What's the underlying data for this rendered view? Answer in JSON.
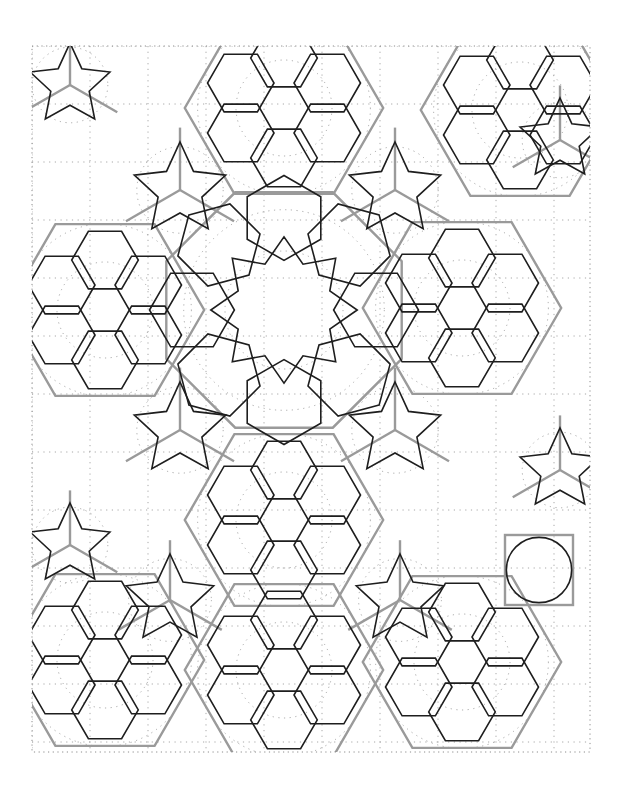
{
  "figure": {
    "title": "Geometric strapwork pattern with 6-fold and 8-fold rosettes",
    "width": 623,
    "height": 796,
    "frame": {
      "x0": 32,
      "y0": 46,
      "x1": 590,
      "y1": 752
    },
    "colors": {
      "background": "#ffffff",
      "strap": "#1e1e1e",
      "construction": "#9a9a9a",
      "dotted": "#8c8c8c"
    },
    "stroke_widths": {
      "strap": 1.6,
      "construction": 2.4,
      "dotted": 1.0
    }
  },
  "rosettes": {
    "hex": [
      {
        "cx": 284,
        "cy": 108,
        "r": 64
      },
      {
        "cx": 105,
        "cy": 310,
        "r": 64
      },
      {
        "cx": 462,
        "cy": 308,
        "r": 64
      },
      {
        "cx": 284,
        "cy": 520,
        "r": 64
      },
      {
        "cx": 284,
        "cy": 670,
        "r": 64
      },
      {
        "cx": 105,
        "cy": 660,
        "r": 64
      },
      {
        "cx": 462,
        "cy": 662,
        "r": 64
      },
      {
        "cx": 520,
        "cy": 110,
        "r": 64
      }
    ],
    "oct": [
      {
        "cx": 284,
        "cy": 310,
        "r": 118
      }
    ],
    "star5": [
      {
        "cx": 70,
        "cy": 85,
        "r": 42
      },
      {
        "cx": 180,
        "cy": 190,
        "r": 48
      },
      {
        "cx": 395,
        "cy": 190,
        "r": 48
      },
      {
        "cx": 180,
        "cy": 430,
        "r": 48
      },
      {
        "cx": 395,
        "cy": 430,
        "r": 48
      },
      {
        "cx": 70,
        "cy": 545,
        "r": 42
      },
      {
        "cx": 560,
        "cy": 470,
        "r": 42
      },
      {
        "cx": 560,
        "cy": 140,
        "r": 42
      },
      {
        "cx": 170,
        "cy": 600,
        "r": 46
      },
      {
        "cx": 400,
        "cy": 600,
        "r": 46
      }
    ]
  },
  "construction": {
    "hex_outline_scale": 1.55,
    "oct_outline_scale": 1.08,
    "square_box": {
      "x": 505,
      "y": 535,
      "w": 68,
      "h": 70
    }
  },
  "grid": {
    "dot_spacing_x": 58,
    "dot_spacing_y": 58
  }
}
